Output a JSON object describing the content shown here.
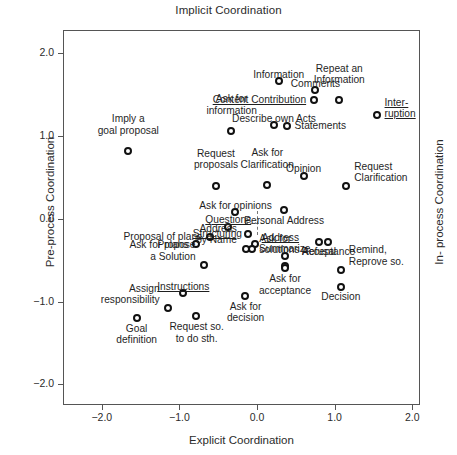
{
  "chart_data": {
    "type": "scatter",
    "title": "Implicit Coordination",
    "xlabel": "Explicit Coordination",
    "ylabel": "Pre-process Coordination",
    "ylabel_right": "In- process Coordination",
    "xlim": [
      -2.5,
      2.1
    ],
    "ylim": [
      -2.25,
      2.28
    ],
    "xticks": [
      -2.0,
      -1.0,
      0.0,
      1.0,
      2.0
    ],
    "xticklabels": [
      "−2.0",
      "−1.0",
      "0.0",
      "1.0",
      "2.0"
    ],
    "yticks": [
      -2.0,
      -1.0,
      0.0,
      1.0,
      2.0
    ],
    "yticklabels": [
      "−2.0",
      "−1.0",
      "0.0",
      "1.0",
      "2.0"
    ],
    "grid": false,
    "legend": "none",
    "marker": "open-circle",
    "annotations": [
      {
        "label": "Information",
        "x": 0.28,
        "y": 1.66,
        "underline": false,
        "align": "center",
        "dx": 0,
        "dy": -13
      },
      {
        "label": "Comments",
        "x": 0.75,
        "y": 1.55,
        "underline": false,
        "align": "center",
        "dx": 0,
        "dy": -13
      },
      {
        "label": "Content Contribution",
        "x": 0.73,
        "y": 1.44,
        "underline": true,
        "align": "right",
        "dx": -8,
        "dy": -6
      },
      {
        "label": "Repeat an\nInformation",
        "x": 1.06,
        "y": 1.43,
        "underline": false,
        "align": "center",
        "dx": 0,
        "dy": -26
      },
      {
        "label": "Inter-\nruption",
        "x": 1.54,
        "y": 1.25,
        "underline": true,
        "align": "left",
        "dx": 8,
        "dy": -7
      },
      {
        "label": "Describe own Acts",
        "x": 0.22,
        "y": 1.13,
        "underline": false,
        "align": "center",
        "dx": 0,
        "dy": -13
      },
      {
        "label": "Statements",
        "x": 0.38,
        "y": 1.12,
        "underline": false,
        "align": "left",
        "dx": 8,
        "dy": -6
      },
      {
        "label": "Ask for\ninformation",
        "x": -0.33,
        "y": 1.06,
        "underline": false,
        "align": "center",
        "dx": 0,
        "dy": -26
      },
      {
        "label": "Imply a\ngoal proposal",
        "x": -1.66,
        "y": 0.82,
        "underline": false,
        "align": "center",
        "dx": 0,
        "dy": -26
      },
      {
        "label": "Opinion",
        "x": 0.6,
        "y": 0.52,
        "underline": false,
        "align": "center",
        "dx": 0,
        "dy": -13
      },
      {
        "label": "Ask for\nClarification",
        "x": 0.13,
        "y": 0.41,
        "underline": false,
        "align": "center",
        "dx": 0,
        "dy": -26
      },
      {
        "label": "Request\nproposals",
        "x": -0.53,
        "y": 0.4,
        "underline": false,
        "align": "center",
        "dx": 0,
        "dy": -26
      },
      {
        "label": "Request\nClarification",
        "x": 1.15,
        "y": 0.39,
        "underline": false,
        "align": "left",
        "dx": 8,
        "dy": -14
      },
      {
        "label": "Personal Address",
        "x": 0.35,
        "y": 0.1,
        "underline": false,
        "align": "center",
        "dx": 0,
        "dy": 5
      },
      {
        "label": "Ask for opinions",
        "x": -0.28,
        "y": 0.08,
        "underline": false,
        "align": "center",
        "dx": 0,
        "dy": -13
      },
      {
        "label": "Questions",
        "x": -0.37,
        "y": -0.1,
        "underline": true,
        "align": "center",
        "dx": 0,
        "dy": -13
      },
      {
        "label": "Structuring",
        "x": -0.12,
        "y": -0.18,
        "underline": true,
        "align": "right",
        "dx": -6,
        "dy": -6
      },
      {
        "label": "Proposal of plans",
        "x": -0.6,
        "y": -0.22,
        "underline": false,
        "align": "right",
        "dx": -8,
        "dy": -6
      },
      {
        "label": "Ask for plans",
        "x": -0.78,
        "y": -0.31,
        "underline": false,
        "align": "right",
        "dx": -8,
        "dy": -6
      },
      {
        "label": "Address",
        "x": -0.03,
        "y": -0.3,
        "underline": true,
        "align": "left",
        "dx": 7,
        "dy": -12
      },
      {
        "label": "Ask for\nsolutions",
        "x": -0.06,
        "y": -0.36,
        "underline": false,
        "align": "left",
        "dx": 7,
        "dy": -4
      },
      {
        "label": "Address\nby Name",
        "x": -0.14,
        "y": -0.36,
        "underline": false,
        "align": "right",
        "dx": -9,
        "dy": -14
      },
      {
        "label": "Refusal",
        "x": 0.8,
        "y": -0.28,
        "underline": false,
        "align": "center",
        "dx": 0,
        "dy": 4
      },
      {
        "label": "Acceptance",
        "x": 0.92,
        "y": -0.28,
        "underline": false,
        "align": "center",
        "dx": 0,
        "dy": 4
      },
      {
        "label": "Propose\na Solution",
        "x": -0.68,
        "y": -0.56,
        "underline": false,
        "align": "right",
        "dx": -9,
        "dy": -14
      },
      {
        "label": "Summarize",
        "x": 0.36,
        "y": -0.45,
        "underline": false,
        "align": "center",
        "dx": 0,
        "dy": -13
      },
      {
        "label": "Remind,\nReprove so.",
        "x": 1.08,
        "y": -0.62,
        "underline": false,
        "align": "left",
        "dx": 8,
        "dy": -14
      },
      {
        "label": "Ask for\nacceptance",
        "x": 0.36,
        "y": -0.6,
        "underline": false,
        "align": "center",
        "dx": 0,
        "dy": 5
      },
      {
        "label": "Decision",
        "x": 1.08,
        "y": -0.82,
        "underline": false,
        "align": "center",
        "dx": 0,
        "dy": 4
      },
      {
        "label": "Instructions",
        "x": -0.95,
        "y": -0.9,
        "underline": true,
        "align": "center",
        "dx": 0,
        "dy": -13
      },
      {
        "label": "Ask for\ndecision",
        "x": -0.15,
        "y": -0.93,
        "underline": false,
        "align": "center",
        "dx": 0,
        "dy": 5
      },
      {
        "label": "Assign\nresponsibility",
        "x": -1.15,
        "y": -1.08,
        "underline": false,
        "align": "right",
        "dx": -8,
        "dy": -14
      },
      {
        "label": "Request so.\nto do sth.",
        "x": -0.78,
        "y": -1.18,
        "underline": false,
        "align": "center",
        "dx": 0,
        "dy": 5
      },
      {
        "label": "Goal\ndefinition",
        "x": -1.55,
        "y": -1.2,
        "underline": false,
        "align": "center",
        "dx": 0,
        "dy": 5
      }
    ],
    "points": [
      {
        "name": "Information",
        "x": 0.28,
        "y": 1.66
      },
      {
        "name": "Comments",
        "x": 0.75,
        "y": 1.55
      },
      {
        "name": "Content Contribution",
        "x": 0.73,
        "y": 1.44
      },
      {
        "name": "Repeat an Information",
        "x": 1.06,
        "y": 1.43
      },
      {
        "name": "Interruption",
        "x": 1.54,
        "y": 1.25
      },
      {
        "name": "Describe own Acts",
        "x": 0.22,
        "y": 1.13
      },
      {
        "name": "Statements",
        "x": 0.38,
        "y": 1.12
      },
      {
        "name": "Ask for information",
        "x": -0.33,
        "y": 1.06
      },
      {
        "name": "Imply a goal proposal",
        "x": -1.66,
        "y": 0.82
      },
      {
        "name": "Opinion",
        "x": 0.6,
        "y": 0.52
      },
      {
        "name": "Ask for Clarification",
        "x": 0.13,
        "y": 0.41
      },
      {
        "name": "Request proposals",
        "x": -0.53,
        "y": 0.4
      },
      {
        "name": "Request Clarification",
        "x": 1.15,
        "y": 0.39
      },
      {
        "name": "Personal Address",
        "x": 0.35,
        "y": 0.1
      },
      {
        "name": "Ask for opinions",
        "x": -0.28,
        "y": 0.08
      },
      {
        "name": "Questions",
        "x": -0.37,
        "y": -0.1
      },
      {
        "name": "Structuring",
        "x": -0.12,
        "y": -0.18
      },
      {
        "name": "Proposal of plans",
        "x": -0.6,
        "y": -0.22
      },
      {
        "name": "Ask for plans",
        "x": -0.78,
        "y": -0.31
      },
      {
        "name": "Address",
        "x": -0.03,
        "y": -0.3
      },
      {
        "name": "Ask for solutions",
        "x": -0.06,
        "y": -0.36
      },
      {
        "name": "Address by Name",
        "x": -0.14,
        "y": -0.36
      },
      {
        "name": "Refusal",
        "x": 0.8,
        "y": -0.28
      },
      {
        "name": "Acceptance",
        "x": 0.92,
        "y": -0.28
      },
      {
        "name": "Propose a Solution",
        "x": -0.68,
        "y": -0.56
      },
      {
        "name": "Summarize upper",
        "x": 0.36,
        "y": -0.45
      },
      {
        "name": "Summarize lower",
        "x": 0.36,
        "y": -0.57
      },
      {
        "name": "Remind, Reprove so.",
        "x": 1.08,
        "y": -0.62
      },
      {
        "name": "Ask for acceptance",
        "x": 0.36,
        "y": -0.6
      },
      {
        "name": "Decision",
        "x": 1.08,
        "y": -0.82
      },
      {
        "name": "Instructions",
        "x": -0.95,
        "y": -0.9
      },
      {
        "name": "Ask for decision",
        "x": -0.15,
        "y": -0.93
      },
      {
        "name": "Assign responsibility",
        "x": -1.15,
        "y": -1.08
      },
      {
        "name": "Request so. to do sth.",
        "x": -0.78,
        "y": -1.18
      },
      {
        "name": "Goal definition",
        "x": -1.55,
        "y": -1.2
      }
    ],
    "origin_marker": {
      "x": 0.0,
      "y": -0.05,
      "style": "dashed-crosshair"
    }
  }
}
